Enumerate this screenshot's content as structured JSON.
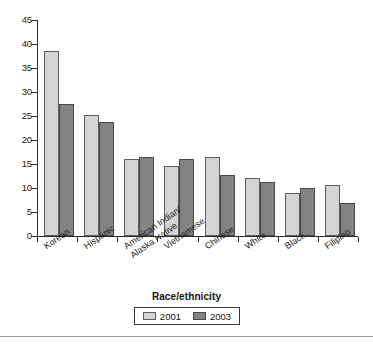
{
  "chart_data": {
    "type": "bar",
    "title": "",
    "xlabel": "Race/ethnicity",
    "ylabel": "",
    "ylim": [
      0,
      45
    ],
    "yticks": [
      0,
      5,
      10,
      15,
      20,
      25,
      30,
      35,
      40,
      45
    ],
    "grid": false,
    "legend_position": "bottom",
    "categories": [
      "Korean",
      "Hispanic",
      "American Indian/\nAlaska Native",
      "Vietnamese",
      "Chinese",
      "White",
      "Black",
      "Filipino"
    ],
    "series": [
      {
        "name": "2001",
        "color": "#d4d4d4",
        "values": [
          38.5,
          25.3,
          16.0,
          14.5,
          16.5,
          12.0,
          8.9,
          10.6
        ]
      },
      {
        "name": "2003",
        "color": "#828282",
        "values": [
          27.6,
          23.8,
          16.5,
          16.0,
          12.8,
          11.2,
          10.1,
          6.9
        ]
      }
    ]
  },
  "axis": {
    "y_tick_labels": [
      "0",
      "5",
      "10",
      "15",
      "20",
      "25",
      "30",
      "35",
      "40",
      "45"
    ],
    "x_title": "Race/ethnicity"
  },
  "categories_display": [
    "Korean",
    "Hispanic",
    "American Indian/",
    "Alaska Native",
    "Vietnamese",
    "Chinese",
    "White",
    "Black",
    "Filipino"
  ],
  "legend": {
    "entries": [
      {
        "label": "2001",
        "color": "#d4d4d4"
      },
      {
        "label": "2003",
        "color": "#828282"
      }
    ]
  }
}
